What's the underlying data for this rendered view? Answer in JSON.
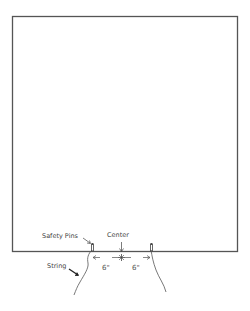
{
  "diagram": {
    "labels": {
      "safety_pins": "Safety Pins",
      "center": "Center",
      "string": "String",
      "left_distance": "6\"",
      "right_distance": "6\""
    },
    "colors": {
      "outline": "#555555",
      "text": "#444444",
      "background": "#ffffff"
    }
  }
}
